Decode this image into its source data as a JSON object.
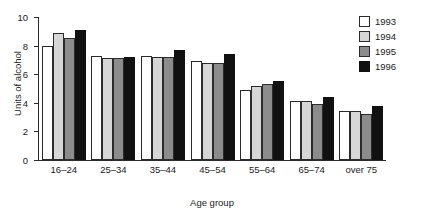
{
  "chart_data": {
    "type": "bar",
    "title": "",
    "xlabel": "Age group",
    "ylabel": "Units of alcohol",
    "ylim": [
      0,
      10
    ],
    "yticks": [
      0,
      2,
      4,
      6,
      8,
      10
    ],
    "ytick_labels": [
      "0",
      "2",
      "4",
      "6",
      "8",
      "10"
    ],
    "grid": false,
    "legend_position": "top-right",
    "categories": [
      "16–24",
      "25–34",
      "35–44",
      "45–54",
      "55–64",
      "65–74",
      "over 75"
    ],
    "series": [
      {
        "name": "1993",
        "color": "#ffffff",
        "values": [
          8.0,
          7.3,
          7.3,
          6.9,
          4.9,
          4.1,
          3.4
        ]
      },
      {
        "name": "1994",
        "color": "#d6d6d6",
        "values": [
          8.9,
          7.1,
          7.2,
          6.8,
          5.2,
          4.1,
          3.4
        ]
      },
      {
        "name": "1995",
        "color": "#8c8c8c",
        "values": [
          8.5,
          7.1,
          7.2,
          6.8,
          5.3,
          3.9,
          3.2
        ]
      },
      {
        "name": "1996",
        "color": "#111111",
        "values": [
          9.1,
          7.2,
          7.7,
          7.4,
          5.5,
          4.4,
          3.8
        ]
      }
    ]
  },
  "legend": {
    "entries": [
      {
        "label": "1993"
      },
      {
        "label": "1994"
      },
      {
        "label": "1995"
      },
      {
        "label": "1996"
      }
    ]
  }
}
